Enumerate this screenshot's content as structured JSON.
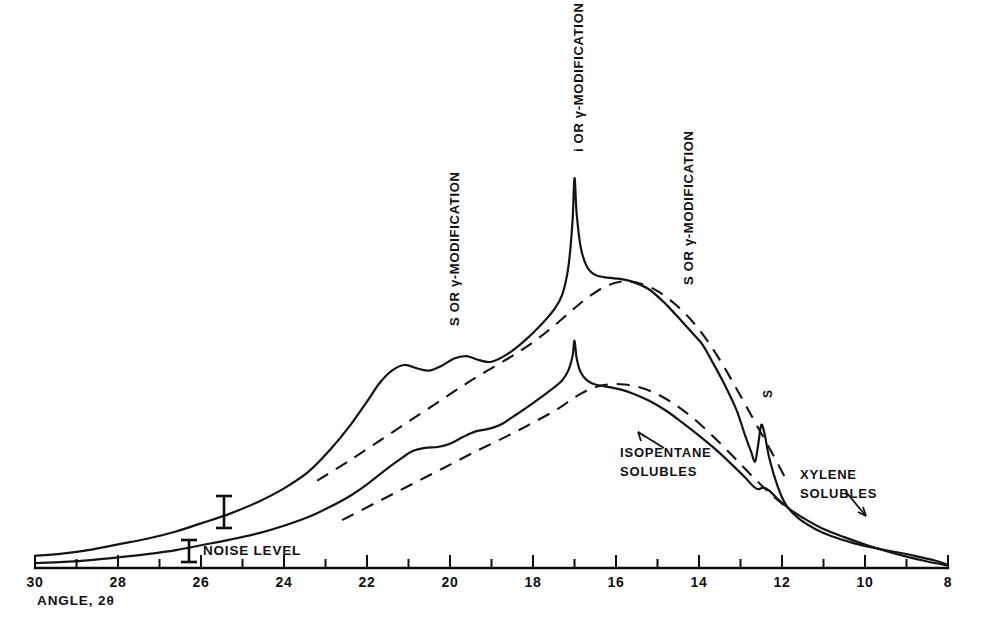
{
  "chart_data": {
    "type": "line",
    "title": "",
    "subtitle": "",
    "xlabel": "ANGLE, 2θ",
    "ylabel": "",
    "xlim": [
      30,
      8
    ],
    "x_axis_direction": "decreasing",
    "xticks": [
      30,
      29,
      28,
      27,
      26,
      25,
      24,
      23,
      22,
      21,
      20,
      19,
      18,
      17,
      16,
      15,
      14,
      13,
      12,
      11,
      10,
      9,
      8
    ],
    "xtick_labels": [
      "30",
      "",
      "28",
      "",
      "26",
      "",
      "24",
      "",
      "22",
      "",
      "20",
      "",
      "18",
      "",
      "16",
      "",
      "14",
      "",
      "12",
      "",
      "10",
      "",
      "8"
    ],
    "xtick_labels_shown": [
      "30",
      "28",
      "26",
      "24",
      "22",
      "20",
      "18",
      "16",
      "14",
      "12",
      "10",
      "8"
    ],
    "grid": false,
    "legend": "none",
    "y_axis_shown": false,
    "series": [
      {
        "name": "XYLENE SOLUBLES",
        "style": "solid",
        "description": "Upper intensity trace; broad amorphous halo with shoulders near 2θ = 21 and 20, a sharp crystalline peak at 2θ ≈ 17, a shoulder near 14, and a sharp S peak at 2θ ≈ 12.5",
        "points": [
          [
            30.0,
            0.03
          ],
          [
            29.3,
            0.036
          ],
          [
            28.6,
            0.046
          ],
          [
            28.0,
            0.058
          ],
          [
            27.3,
            0.072
          ],
          [
            26.6,
            0.09
          ],
          [
            26.0,
            0.11
          ],
          [
            25.3,
            0.134
          ],
          [
            24.6,
            0.164
          ],
          [
            24.0,
            0.196
          ],
          [
            23.4,
            0.238
          ],
          [
            22.9,
            0.29
          ],
          [
            22.4,
            0.352
          ],
          [
            22.0,
            0.41
          ],
          [
            21.7,
            0.455
          ],
          [
            21.4,
            0.486
          ],
          [
            21.1,
            0.5
          ],
          [
            20.8,
            0.492
          ],
          [
            20.5,
            0.486
          ],
          [
            20.2,
            0.498
          ],
          [
            19.9,
            0.516
          ],
          [
            19.6,
            0.522
          ],
          [
            19.3,
            0.512
          ],
          [
            19.0,
            0.508
          ],
          [
            18.6,
            0.528
          ],
          [
            18.2,
            0.56
          ],
          [
            17.8,
            0.6
          ],
          [
            17.5,
            0.636
          ],
          [
            17.3,
            0.672
          ],
          [
            17.15,
            0.74
          ],
          [
            17.05,
            0.85
          ],
          [
            17.0,
            0.96
          ],
          [
            16.95,
            0.875
          ],
          [
            16.85,
            0.79
          ],
          [
            16.7,
            0.742
          ],
          [
            16.5,
            0.722
          ],
          [
            16.2,
            0.715
          ],
          [
            15.9,
            0.712
          ],
          [
            15.6,
            0.705
          ],
          [
            15.2,
            0.686
          ],
          [
            14.8,
            0.65
          ],
          [
            14.4,
            0.606
          ],
          [
            14.1,
            0.572
          ],
          [
            13.9,
            0.548
          ],
          [
            13.7,
            0.512
          ],
          [
            13.4,
            0.455
          ],
          [
            13.1,
            0.39
          ],
          [
            12.9,
            0.33
          ],
          [
            12.75,
            0.288
          ],
          [
            12.65,
            0.262
          ],
          [
            12.58,
            0.3
          ],
          [
            12.5,
            0.352
          ],
          [
            12.42,
            0.33
          ],
          [
            12.3,
            0.268
          ],
          [
            12.1,
            0.2
          ],
          [
            11.9,
            0.155
          ],
          [
            11.6,
            0.122
          ],
          [
            11.2,
            0.096
          ],
          [
            10.8,
            0.078
          ],
          [
            10.3,
            0.062
          ],
          [
            9.8,
            0.05
          ],
          [
            9.3,
            0.04
          ],
          [
            8.8,
            0.03
          ],
          [
            8.3,
            0.018
          ],
          [
            8.0,
            0.008
          ]
        ]
      },
      {
        "name": "ISOPENTANE SOLUBLES",
        "style": "solid",
        "description": "Lower intensity trace; broad amorphous halo with a small shoulder near 2θ = 20, a modest peak at 2θ ≈ 17, and a small shoulder near 2θ ≈ 12.5",
        "points": [
          [
            30.0,
            0.012
          ],
          [
            29.3,
            0.015
          ],
          [
            28.6,
            0.02
          ],
          [
            28.0,
            0.026
          ],
          [
            27.3,
            0.034
          ],
          [
            26.6,
            0.044
          ],
          [
            26.0,
            0.056
          ],
          [
            25.3,
            0.07
          ],
          [
            24.6,
            0.086
          ],
          [
            24.0,
            0.104
          ],
          [
            23.4,
            0.126
          ],
          [
            22.9,
            0.15
          ],
          [
            22.4,
            0.178
          ],
          [
            22.0,
            0.206
          ],
          [
            21.6,
            0.238
          ],
          [
            21.2,
            0.268
          ],
          [
            20.9,
            0.288
          ],
          [
            20.6,
            0.296
          ],
          [
            20.3,
            0.298
          ],
          [
            20.0,
            0.306
          ],
          [
            19.7,
            0.322
          ],
          [
            19.4,
            0.336
          ],
          [
            19.1,
            0.342
          ],
          [
            18.8,
            0.352
          ],
          [
            18.4,
            0.378
          ],
          [
            18.0,
            0.406
          ],
          [
            17.6,
            0.436
          ],
          [
            17.3,
            0.462
          ],
          [
            17.15,
            0.486
          ],
          [
            17.05,
            0.52
          ],
          [
            17.0,
            0.56
          ],
          [
            16.95,
            0.518
          ],
          [
            16.85,
            0.482
          ],
          [
            16.7,
            0.462
          ],
          [
            16.5,
            0.452
          ],
          [
            16.2,
            0.446
          ],
          [
            15.9,
            0.44
          ],
          [
            15.6,
            0.43
          ],
          [
            15.2,
            0.412
          ],
          [
            14.8,
            0.388
          ],
          [
            14.4,
            0.358
          ],
          [
            14.0,
            0.326
          ],
          [
            13.6,
            0.292
          ],
          [
            13.2,
            0.254
          ],
          [
            12.9,
            0.224
          ],
          [
            12.7,
            0.202
          ],
          [
            12.58,
            0.194
          ],
          [
            12.45,
            0.198
          ],
          [
            12.3,
            0.19
          ],
          [
            12.1,
            0.17
          ],
          [
            11.8,
            0.144
          ],
          [
            11.4,
            0.118
          ],
          [
            11.0,
            0.096
          ],
          [
            10.5,
            0.076
          ],
          [
            10.0,
            0.058
          ],
          [
            9.5,
            0.042
          ],
          [
            9.0,
            0.028
          ],
          [
            8.5,
            0.016
          ],
          [
            8.0,
            0.006
          ]
        ]
      },
      {
        "name": "xylene-baseline",
        "style": "dashed",
        "description": "Dashed amorphous-halo baseline drawn under the xylene solubles trace",
        "points": [
          [
            23.2,
            0.215
          ],
          [
            22.4,
            0.266
          ],
          [
            21.6,
            0.32
          ],
          [
            20.8,
            0.374
          ],
          [
            20.0,
            0.428
          ],
          [
            19.3,
            0.474
          ],
          [
            18.6,
            0.516
          ],
          [
            18.0,
            0.556
          ],
          [
            17.5,
            0.596
          ],
          [
            17.0,
            0.64
          ],
          [
            16.6,
            0.672
          ],
          [
            16.2,
            0.696
          ],
          [
            15.8,
            0.706
          ],
          [
            15.4,
            0.7
          ],
          [
            15.0,
            0.682
          ],
          [
            14.6,
            0.652
          ],
          [
            14.2,
            0.612
          ],
          [
            13.8,
            0.56
          ],
          [
            13.4,
            0.496
          ],
          [
            13.0,
            0.424
          ],
          [
            12.6,
            0.35
          ],
          [
            12.2,
            0.276
          ],
          [
            11.9,
            0.218
          ]
        ]
      },
      {
        "name": "isopentane-baseline",
        "style": "dashed",
        "description": "Dashed amorphous-halo baseline drawn under the isopentane solubles trace",
        "points": [
          [
            22.6,
            0.118
          ],
          [
            21.8,
            0.16
          ],
          [
            21.0,
            0.202
          ],
          [
            20.2,
            0.244
          ],
          [
            19.4,
            0.286
          ],
          [
            18.6,
            0.326
          ],
          [
            18.0,
            0.358
          ],
          [
            17.4,
            0.392
          ],
          [
            17.0,
            0.42
          ],
          [
            16.6,
            0.442
          ],
          [
            16.2,
            0.452
          ],
          [
            15.8,
            0.452
          ],
          [
            15.4,
            0.444
          ],
          [
            15.0,
            0.428
          ],
          [
            14.6,
            0.404
          ],
          [
            14.2,
            0.374
          ],
          [
            13.8,
            0.338
          ],
          [
            13.4,
            0.298
          ],
          [
            13.0,
            0.256
          ],
          [
            12.6,
            0.214
          ],
          [
            12.2,
            0.176
          ],
          [
            11.8,
            0.142
          ]
        ]
      }
    ],
    "annotations": [
      {
        "id": "ann-left",
        "text": "S OR γ-MODIFICATION",
        "orientation": "vertical",
        "x_value": 20.2
      },
      {
        "id": "ann-center",
        "text": "i OR γ-MODIFICATION",
        "orientation": "vertical",
        "x_value": 17.0
      },
      {
        "id": "ann-right",
        "text": "S OR γ-MODIFICATION",
        "orientation": "vertical",
        "x_value": 14.1
      },
      {
        "id": "ann-s",
        "text": "S",
        "orientation": "vertical",
        "x_value": 12.5
      },
      {
        "id": "ann-isopentane",
        "text": "ISOPENTANE\nSOLUBLES",
        "orientation": "horizontal",
        "x_value": 15.5
      },
      {
        "id": "ann-xylene",
        "text": "XYLENE\nSOLUBLES",
        "orientation": "horizontal",
        "x_value": 10.7
      },
      {
        "id": "ann-noise",
        "text": "NOISE LEVEL",
        "orientation": "horizontal",
        "x_value": 25.9
      }
    ],
    "noise_markers": [
      {
        "id": "noise-upper",
        "x_value": 26.4,
        "description": "I-beam error bar on xylene solubles trace"
      },
      {
        "id": "noise-lower",
        "x_value": 26.6,
        "description": "I-beam error bar on isopentane solubles trace"
      }
    ]
  },
  "axis": {
    "title": "ANGLE, 2θ",
    "labels": [
      "30",
      "28",
      "26",
      "24",
      "22",
      "20",
      "18",
      "16",
      "14",
      "12",
      "10",
      "8"
    ]
  },
  "labels": {
    "left_modification": "S OR γ-MODIFICATION",
    "center_modification": "i OR γ-MODIFICATION",
    "right_modification": "S OR γ-MODIFICATION",
    "s_peak": "S",
    "isopentane": "ISOPENTANE\nSOLUBLES",
    "xylene": "XYLENE\nSOLUBLES",
    "noise_level": "NOISE LEVEL"
  },
  "colors": {
    "ink": "#141414",
    "background": "#ffffff"
  }
}
